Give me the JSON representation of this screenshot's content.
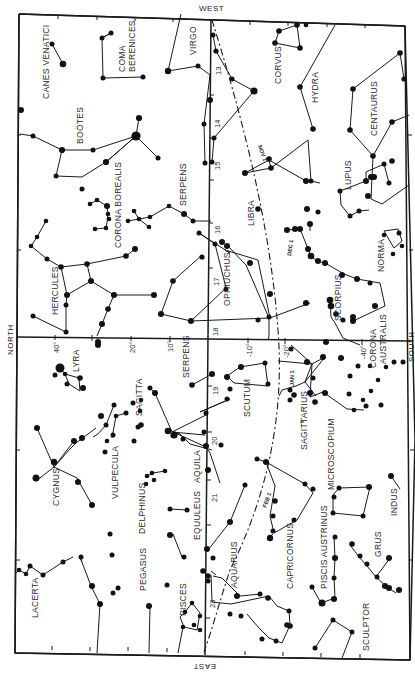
{
  "map": {
    "title": "Star chart — summer evening sky",
    "directions": {
      "top": "WEST",
      "bottom": "EAST",
      "left": "NORTH",
      "right": "SOUTH"
    },
    "right_ascension_ticks": [
      "13",
      "14",
      "15",
      "16",
      "17",
      "18",
      "19",
      "20",
      "21",
      "23"
    ],
    "declination_ticks": [
      "40°",
      "20°",
      "10°",
      "-10°",
      "-20°",
      "-40°"
    ],
    "ecliptic_dates": [
      "NOV 1",
      "DEC 1",
      "JAN 1",
      "FEB 1"
    ],
    "constellations": [
      "CANES VENATICI",
      "COMA BERENICES",
      "VIRGO",
      "CORVUS",
      "HYDRA",
      "CENTAURUS",
      "BOÖTES",
      "CORONA BOREALIS",
      "SERPENS",
      "LIBRA",
      "LUPUS",
      "NORMA",
      "HERCULES",
      "OPHIUCHUS",
      "SCORPIUS",
      "CORONA AUSTRALIS",
      "LYRA",
      "SERPENS",
      "SAGITTA",
      "SCUTUM",
      "SAGITTARIUS",
      "VULPECULA",
      "CYGNUS",
      "DELPHINUS",
      "AQUILA",
      "MICROSCOPIUM",
      "EQUULEUS",
      "AQUARIUS",
      "CAPRICORNUS",
      "INDUS",
      "PISCIS AUSTRINUS",
      "GRUS",
      "LACERTA",
      "PEGASUS",
      "PISCES",
      "SCULPTOR"
    ]
  },
  "labels": {
    "west": "WEST",
    "east": "EAST",
    "north": "NORTH",
    "south": "SOUTH",
    "canes": "CANES VENATICI",
    "coma1": "COMA",
    "coma2": "BERENICES",
    "virgo": "VIRGO",
    "corvus": "CORVUS",
    "hydra": "HYDRA",
    "centaurus": "CENTAURUS",
    "bootes": "BOÖTES",
    "corona_b": "CORONA BOREALIS",
    "serpens1": "SERPENS",
    "libra": "LIBRA",
    "lupus": "LUPUS",
    "norma": "NORMA",
    "hercules": "HERCULES",
    "ophiuchus": "OPHIUCHUS",
    "scorpius": "SCORPIUS",
    "corona_a1": "CORONA",
    "corona_a2": "AUSTRALIS",
    "lyra": "LYRA",
    "serpens2": "SERPENS",
    "sagitta": "SAGITTA",
    "scutum": "SCUTUM",
    "sagittarius": "SAGITTARIUS",
    "vulpecula": "VULPECULA",
    "cygnus": "CYGNUS",
    "delphinus": "DELPHINUS",
    "aquila": "AQUILA",
    "microscopium": "MICROSCOPIUM",
    "equuleus": "EQUULEUS",
    "aquarius": "AQUARIUS",
    "capricornus": "CAPRICORNUS",
    "indus": "INDUS",
    "piscis_austrinus": "PISCIS AUSTRINUS",
    "grus": "GRUS",
    "lacerta": "LACERTA",
    "pegasus": "PEGASUS",
    "pisces": "PISCES",
    "sculptor": "SCULPTOR",
    "ra13": "13",
    "ra14": "14",
    "ra15": "15",
    "ra16": "16",
    "ra17": "17",
    "ra18": "18",
    "ra19": "19",
    "ra20": "20",
    "ra21": "21",
    "ra23": "23",
    "dec40": "40°",
    "dec20": "20°",
    "dec10": "10°",
    "decm10": "-10°",
    "decm20": "-20°",
    "decm40": "-40°",
    "nov1": "NOV 1",
    "dec1": "DEC 1",
    "jan1": "JAN 1",
    "feb1": "FEB 1"
  }
}
